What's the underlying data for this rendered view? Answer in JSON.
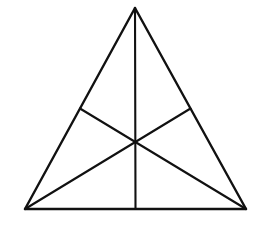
{
  "diagram": {
    "stroke_color": "#111111",
    "background_color": "#ffffff",
    "vertices": [
      "A",
      "B",
      "C"
    ],
    "vertex_roles": {
      "A": "apex",
      "B": "bottom-left",
      "C": "bottom-right"
    },
    "edges": [
      {
        "from": "A",
        "to": "B"
      },
      {
        "from": "A",
        "to": "C"
      },
      {
        "from": "B",
        "to": "C"
      }
    ],
    "medians": [
      {
        "from": "A",
        "to_midpoint_of": [
          "B",
          "C"
        ]
      },
      {
        "from": "B",
        "to_midpoint_of": [
          "A",
          "C"
        ]
      },
      {
        "from": "C",
        "to_midpoint_of": [
          "A",
          "B"
        ]
      }
    ],
    "intersection": "centroid",
    "labels_visible": false
  }
}
